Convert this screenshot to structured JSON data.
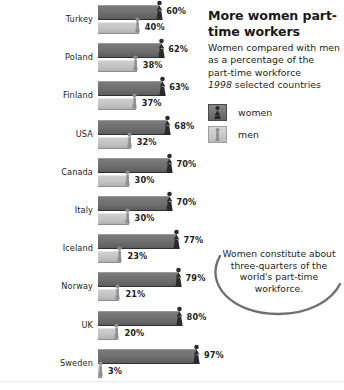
{
  "panel": {
    "title": "More women part-time workers",
    "subtitle_line1": "Women compared with men",
    "subtitle_line2": "as a percentage of the",
    "subtitle_line3": "part-time workforce",
    "year": "1998",
    "year_suffix": "selected countries",
    "legend": [
      {
        "label": "women",
        "key": "women",
        "color": "#6e6e6e",
        "icon": "female-figure-icon"
      },
      {
        "label": "men",
        "key": "men",
        "color": "#c2c2c2",
        "icon": "male-figure-icon"
      }
    ]
  },
  "callout": {
    "text": "Women constitute about three-quarters of the world's part-time workforce."
  },
  "chart_data": {
    "type": "bar",
    "title": "More women part-time workers",
    "subtitle": "Women compared with men as a percentage of the part-time workforce",
    "xlabel": "",
    "ylabel": "",
    "xlim": [
      0,
      100
    ],
    "grid": false,
    "legend_position": "top-right",
    "annotations": [
      "Women constitute about three-quarters of the world's part-time workforce."
    ],
    "note": "1998 selected countries",
    "units": "percent",
    "categories": [
      "Turkey",
      "Poland",
      "Finland",
      "USA",
      "Canada",
      "Italy",
      "Iceland",
      "Norway",
      "UK",
      "Sweden"
    ],
    "series": [
      {
        "name": "women",
        "color": "#6e6e6e",
        "values": [
          60,
          62,
          63,
          68,
          70,
          70,
          77,
          79,
          80,
          97
        ],
        "labels": [
          "60%",
          "62%",
          "63%",
          "68%",
          "70%",
          "70%",
          "77%",
          "79%",
          "80%",
          "97%"
        ]
      },
      {
        "name": "men",
        "color": "#c2c2c2",
        "values": [
          40,
          38,
          37,
          32,
          30,
          30,
          23,
          21,
          20,
          3
        ],
        "labels": [
          "40%",
          "38%",
          "37%",
          "32%",
          "30%",
          "30%",
          "23%",
          "21%",
          "20%",
          "3%"
        ]
      }
    ]
  }
}
